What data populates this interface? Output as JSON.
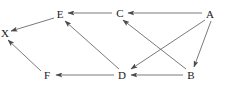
{
  "figure": {
    "width": 227,
    "height": 90,
    "background_color": "#ffffff",
    "line_color": "#6b6b6b",
    "label_color": "#1a1a1a"
  },
  "chart_data": {
    "type": "diagram",
    "subtype": "directed-graph",
    "title": "",
    "directed": true,
    "nodes": [
      {
        "id": "E",
        "label": "E",
        "x": 60,
        "y": 14
      },
      {
        "id": "X",
        "label": "X",
        "x": 5,
        "y": 33
      },
      {
        "id": "C",
        "label": "C",
        "x": 120,
        "y": 13
      },
      {
        "id": "A",
        "label": "A",
        "x": 210,
        "y": 14
      },
      {
        "id": "F",
        "label": "F",
        "x": 47,
        "y": 75
      },
      {
        "id": "D",
        "label": "D",
        "x": 122,
        "y": 75
      },
      {
        "id": "B",
        "label": "B",
        "x": 191,
        "y": 75
      }
    ],
    "edges": [
      {
        "from": "C",
        "to": "E",
        "x1": 112,
        "y1": 13,
        "x2": 68,
        "y2": 13
      },
      {
        "from": "E",
        "to": "X",
        "x1": 54,
        "y1": 18,
        "x2": 11,
        "y2": 31
      },
      {
        "from": "A",
        "to": "C",
        "x1": 202,
        "y1": 13,
        "x2": 128,
        "y2": 13
      },
      {
        "from": "D",
        "to": "E",
        "x1": 119,
        "y1": 69,
        "x2": 65,
        "y2": 21
      },
      {
        "from": "B",
        "to": "C",
        "x1": 186,
        "y1": 69,
        "x2": 123,
        "y2": 20
      },
      {
        "from": "A",
        "to": "D",
        "x1": 205,
        "y1": 20,
        "x2": 131,
        "y2": 69
      },
      {
        "from": "A",
        "to": "B",
        "x1": 211,
        "y1": 21,
        "x2": 194,
        "y2": 67
      },
      {
        "from": "B",
        "to": "D",
        "x1": 183,
        "y1": 75,
        "x2": 131,
        "y2": 75
      },
      {
        "from": "D",
        "to": "F",
        "x1": 114,
        "y1": 75,
        "x2": 56,
        "y2": 75
      },
      {
        "from": "F",
        "to": "X",
        "x1": 41,
        "y1": 71,
        "x2": 8,
        "y2": 40
      }
    ],
    "node_count": 7,
    "edge_count": 10
  }
}
